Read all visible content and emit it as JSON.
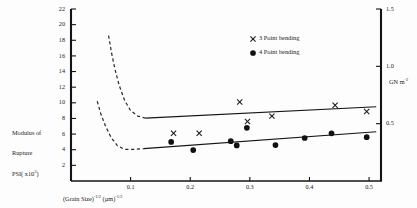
{
  "chart_data": {
    "type": "scatter",
    "title": "",
    "xlabel": "(Grain Size)^(-1/2) (µm)^(-1/2)",
    "ylabel": "Modulus of Rupture PSI (x10^3)",
    "ylabel_right": "GN m^-2",
    "xlim": [
      0.0,
      0.52
    ],
    "ylim": [
      0,
      22
    ],
    "ylim_right": [
      0,
      1.5
    ],
    "grid": false,
    "legend_position": "top-right",
    "xticks": [
      "0.1",
      "0.2",
      "0.3",
      "0.4",
      "0.5"
    ],
    "xtick_values": [
      0.1,
      0.2,
      0.3,
      0.4,
      0.5
    ],
    "yticks": [
      "2",
      "4",
      "6",
      "8",
      "10",
      "12",
      "14",
      "16",
      "18",
      "20",
      "22"
    ],
    "ytick_values": [
      2,
      4,
      6,
      8,
      10,
      12,
      14,
      16,
      18,
      20,
      22
    ],
    "rticks": [
      "0.5",
      "1.0",
      "1.5"
    ],
    "rtick_values": [
      0.5,
      1.0,
      1.5
    ],
    "series": [
      {
        "name": "3 Point bending",
        "marker": "x",
        "points": [
          {
            "x": 0.172,
            "y": 6.1
          },
          {
            "x": 0.215,
            "y": 6.1
          },
          {
            "x": 0.283,
            "y": 10.1
          },
          {
            "x": 0.296,
            "y": 7.6
          },
          {
            "x": 0.337,
            "y": 8.3
          },
          {
            "x": 0.443,
            "y": 9.7
          },
          {
            "x": 0.496,
            "y": 8.9
          }
        ],
        "trendline": {
          "x0": 0.125,
          "y0": 8.05,
          "x1": 0.512,
          "y1": 9.5
        }
      },
      {
        "name": "4 Point bending",
        "marker": "circle",
        "points": [
          {
            "x": 0.168,
            "y": 5.0
          },
          {
            "x": 0.205,
            "y": 3.95
          },
          {
            "x": 0.268,
            "y": 5.1
          },
          {
            "x": 0.278,
            "y": 4.55
          },
          {
            "x": 0.295,
            "y": 6.8
          },
          {
            "x": 0.343,
            "y": 4.6
          },
          {
            "x": 0.392,
            "y": 5.5
          },
          {
            "x": 0.437,
            "y": 6.1
          },
          {
            "x": 0.496,
            "y": 5.6
          }
        ],
        "trendline": {
          "x0": 0.122,
          "y0": 4.15,
          "x1": 0.512,
          "y1": 6.3
        }
      }
    ],
    "dashed_curves": [
      {
        "name": "upper-bound-curve",
        "points": [
          {
            "x": 0.063,
            "y": 18.6
          },
          {
            "x": 0.068,
            "y": 16.4
          },
          {
            "x": 0.074,
            "y": 14.2
          },
          {
            "x": 0.081,
            "y": 12.2
          },
          {
            "x": 0.09,
            "y": 10.3
          },
          {
            "x": 0.1,
            "y": 9.0
          },
          {
            "x": 0.112,
            "y": 8.3
          },
          {
            "x": 0.125,
            "y": 8.05
          }
        ]
      },
      {
        "name": "lower-bound-curve",
        "points": [
          {
            "x": 0.044,
            "y": 10.2
          },
          {
            "x": 0.05,
            "y": 8.6
          },
          {
            "x": 0.058,
            "y": 7.0
          },
          {
            "x": 0.067,
            "y": 5.6
          },
          {
            "x": 0.078,
            "y": 4.5
          },
          {
            "x": 0.09,
            "y": 4.05
          },
          {
            "x": 0.105,
            "y": 4.05
          },
          {
            "x": 0.122,
            "y": 4.15
          }
        ]
      }
    ]
  },
  "axes": {
    "ylabel_line1": "Modulus of",
    "ylabel_line2": "Rupture",
    "ylabel_line3_main": "PSI",
    "ylabel_line3_paren": "( x10",
    "ylabel_line3_exp": "3",
    "ylabel_line3_close": ")",
    "xlabel_part1": "(Grain Size)",
    "xlabel_exp1": "-1/2",
    "xlabel_part2": "(µm)",
    "xlabel_exp2": "-1/2",
    "rlabel_main": "GN m",
    "rlabel_exp": "-2"
  },
  "legend": {
    "entries": [
      {
        "marker": "x",
        "label": "3 Point bending"
      },
      {
        "marker": "circle",
        "label": "4 Point bending"
      }
    ]
  }
}
